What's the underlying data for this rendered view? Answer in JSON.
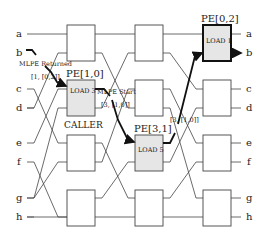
{
  "diagram": {
    "type": "butterfly-network",
    "colors": {
      "line": "#333333",
      "thick": "#111111",
      "shade": "#e6e6e6",
      "box": "#ffffff"
    },
    "row_labels_left": [
      "a",
      "b",
      "c",
      "d",
      "e",
      "f",
      "g",
      "h"
    ],
    "row_labels_right": [
      "a",
      "b",
      "c",
      "d",
      "e",
      "f",
      "g",
      "h"
    ],
    "pe_labels": {
      "pe10": "PE[1,0]",
      "pe31": "PE[3,1]",
      "pe02": "PE[0,2]"
    },
    "box_labels": {
      "pe10": "LOAD 3",
      "pe31": "LOAD 5",
      "pe02": "LOAD 1"
    },
    "annotations": {
      "mlpe_returned": "MLPE Returned",
      "returned_tuple": "[1, [0,2]]",
      "mlpe_start": "MLPE  Start",
      "start_tuple": "[3, [1,0]]",
      "caller": "CALLER",
      "second_tuple": "[3, [1,0]]"
    }
  }
}
